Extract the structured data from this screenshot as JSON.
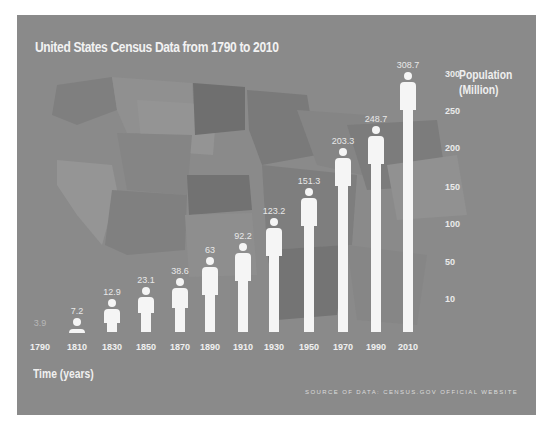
{
  "chart_data": {
    "type": "bar",
    "style": "pictogram (person-shaped bars) over faint US map background",
    "title": "United States Census Data from 1790 to 2010",
    "xlabel": "Time (years)",
    "ylabel": "Population (Million)",
    "ylabel_lines": [
      "Population",
      "(Million)"
    ],
    "categories": [
      "1790",
      "1810",
      "1830",
      "1850",
      "1870",
      "1890",
      "1910",
      "1930",
      "1950",
      "1970",
      "1990",
      "2010"
    ],
    "values": [
      3.9,
      7.2,
      12.9,
      23.1,
      38.6,
      63,
      92.2,
      123.2,
      151.3,
      203.3,
      248.7,
      308.7
    ],
    "value_labels": [
      "3.9",
      "7.2",
      "12.9",
      "23.1",
      "38.6",
      "63",
      "92.2",
      "123.2",
      "151.3",
      "203.3",
      "248.7",
      "308.7"
    ],
    "y_ticks": [
      "300",
      "250",
      "200",
      "150",
      "100",
      "50",
      "10"
    ],
    "ylim": [
      0,
      310
    ],
    "grid": false,
    "legend": null,
    "source_note": "Source of Data: Census.gov official website"
  },
  "colors": {
    "panel_bg": "#8a8a8a",
    "figure": "#f5f5f5",
    "text": "#f0f0f0"
  },
  "layout": {
    "baseline_y": 317,
    "x_centers": [
      23,
      60,
      95,
      129,
      163,
      193,
      226,
      257,
      292,
      326,
      359,
      391
    ],
    "body_top_y": [
      317,
      313,
      294,
      282,
      273,
      252,
      238,
      213,
      183,
      143,
      121,
      67
    ],
    "y_tick_y": [
      60,
      97,
      134,
      173,
      210,
      248,
      285
    ],
    "y_tick_x": 428
  }
}
